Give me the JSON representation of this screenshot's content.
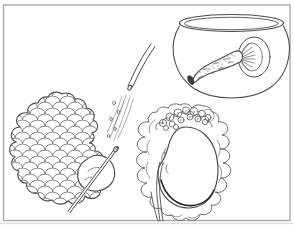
{
  "canvas": {
    "background": "#ffffff",
    "line_color": "#4c4c4c",
    "light_line_color": "#7a7a7a",
    "dark_accent_color": "#2f2f2f",
    "frame_color": "#a3a3a3"
  },
  "figures": {
    "bowl": {
      "label": "glass bowl containing an elongated lobulated organ attached by a striated stalk to a round ball"
    },
    "tube": {
      "label": "curved cannula tube dripping a stream of fluid with droplets"
    },
    "organ": {
      "label": "large lobulated organ mass with a needle inserted at its lower lobe"
    },
    "kidney": {
      "label": "kidney wrapped in ruffled tissue with a nodular graft cluster on top and ureter extending downward"
    },
    "frame": {
      "label": "thin rectangular border frame of the plate"
    }
  }
}
